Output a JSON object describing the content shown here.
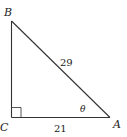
{
  "diagram": {
    "type": "right-triangle",
    "colors": {
      "stroke": "#333333",
      "text": "#222222",
      "background": "#ffffff"
    },
    "vertices": {
      "A": {
        "label": "A"
      },
      "B": {
        "label": "B"
      },
      "C": {
        "label": "C"
      }
    },
    "sides": {
      "hypotenuse": {
        "label": "29",
        "between": "AB"
      },
      "base": {
        "label": "21",
        "between": "CA"
      }
    },
    "angle": {
      "label": "θ",
      "at": "A"
    },
    "right_angle_at": "C"
  }
}
